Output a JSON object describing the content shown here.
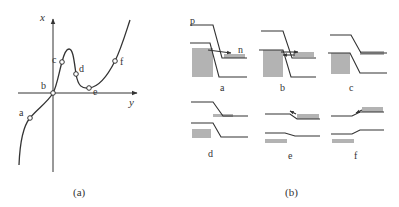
{
  "figure": {
    "panel_a": {
      "caption": "(a)",
      "axis_vertical_label": "x",
      "axis_horizontal_label": "y",
      "points": [
        {
          "label": "a"
        },
        {
          "label": "b"
        },
        {
          "label": "c"
        },
        {
          "label": "d"
        },
        {
          "label": "e"
        },
        {
          "label": "f"
        }
      ]
    },
    "panel_b": {
      "caption": "(b)",
      "side_labels": {
        "p": "p",
        "n": "n"
      },
      "subpanels": [
        {
          "label": "a"
        },
        {
          "label": "b"
        },
        {
          "label": "c"
        },
        {
          "label": "d"
        },
        {
          "label": "e"
        },
        {
          "label": "f"
        }
      ]
    },
    "colors": {
      "line": "#333333",
      "fill": "#b3b3b3",
      "background": "#ffffff"
    }
  }
}
